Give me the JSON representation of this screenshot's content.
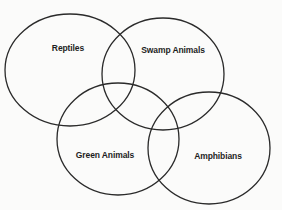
{
  "diagram": {
    "type": "venn",
    "sets": [
      {
        "id": "reptiles",
        "label": "Reptiles",
        "cx": 70,
        "cy": 70,
        "rx": 65,
        "ry": 56,
        "label_x": 68,
        "label_y": 48
      },
      {
        "id": "swamp",
        "label": "Swamp Animals",
        "cx": 163,
        "cy": 74,
        "rx": 61,
        "ry": 56,
        "label_x": 173,
        "label_y": 50
      },
      {
        "id": "green",
        "label": "Green Animals",
        "cx": 118,
        "cy": 139,
        "rx": 61,
        "ry": 56,
        "label_x": 105,
        "label_y": 155
      },
      {
        "id": "amphibians",
        "label": "Amphibians",
        "cx": 209,
        "cy": 148,
        "rx": 61,
        "ry": 56,
        "label_x": 218,
        "label_y": 156
      }
    ],
    "stroke_color": "#2a2a2a",
    "background_color": "#fbfbfa"
  }
}
